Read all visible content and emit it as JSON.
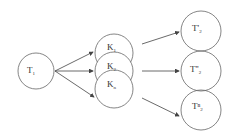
{
  "diagram": {
    "source": {
      "label": "T",
      "sub": "1",
      "cx": 36,
      "cy": 71,
      "r": 18
    },
    "middle": [
      {
        "label": "K",
        "sub": "1",
        "cx": 114,
        "cy": 53,
        "r": 19
      },
      {
        "label": "K",
        "sub": "2",
        "cx": 114,
        "cy": 71,
        "r": 19
      },
      {
        "label": "K",
        "sub": "n",
        "cx": 114,
        "cy": 89,
        "r": 19
      }
    ],
    "targets": [
      {
        "label": "T'",
        "sub": "2",
        "cx": 201,
        "cy": 31,
        "r": 20
      },
      {
        "label": "T''",
        "sub": "2",
        "cx": 201,
        "cy": 71,
        "r": 20
      },
      {
        "label": "Tⁿ",
        "sub": "2",
        "cx": 201,
        "cy": 110,
        "r": 20
      }
    ],
    "colors": {
      "stroke": "#555555",
      "text": "#333333",
      "background": "#ffffff"
    }
  }
}
